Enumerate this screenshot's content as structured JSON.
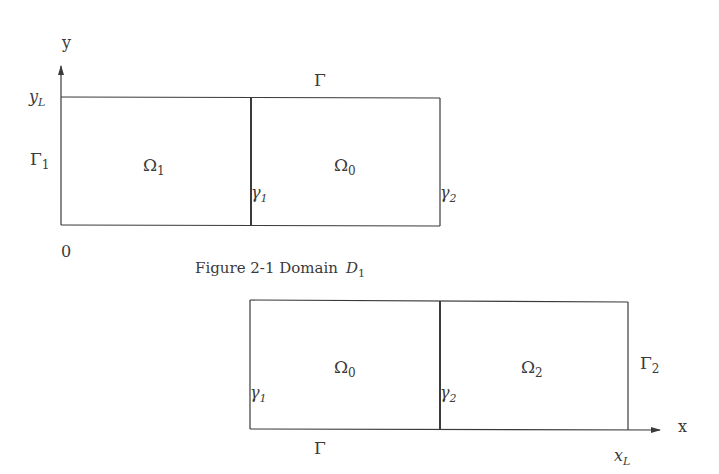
{
  "figure_top": {
    "axis_y_label": "y",
    "y_tick_label": "y",
    "y_tick_sub": "L",
    "origin_label": "0",
    "boundary_top": "Γ",
    "boundary_left": "Γ",
    "boundary_left_sub": "1",
    "region_left": "Ω",
    "region_left_sub": "1",
    "region_right": "Ω",
    "region_right_sub": "0",
    "interface_mid": "γ",
    "interface_mid_sub": "1",
    "interface_right": "γ",
    "interface_right_sub": "2",
    "caption_prefix": "Figure 2-1  Domain",
    "caption_symbol": "D",
    "caption_symbol_sub": "1"
  },
  "figure_bottom": {
    "axis_x_label": "x",
    "x_tick_label": "x",
    "x_tick_sub": "L",
    "boundary_bottom": "Γ",
    "boundary_right": "Γ",
    "boundary_right_sub": "2",
    "region_left": "Ω",
    "region_left_sub": "0",
    "region_right": "Ω",
    "region_right_sub": "2",
    "interface_left": "γ",
    "interface_left_sub": "1",
    "interface_mid": "γ",
    "interface_mid_sub": "2"
  },
  "colors": {
    "line": "#3a3a3a",
    "background": "#ffffff"
  }
}
